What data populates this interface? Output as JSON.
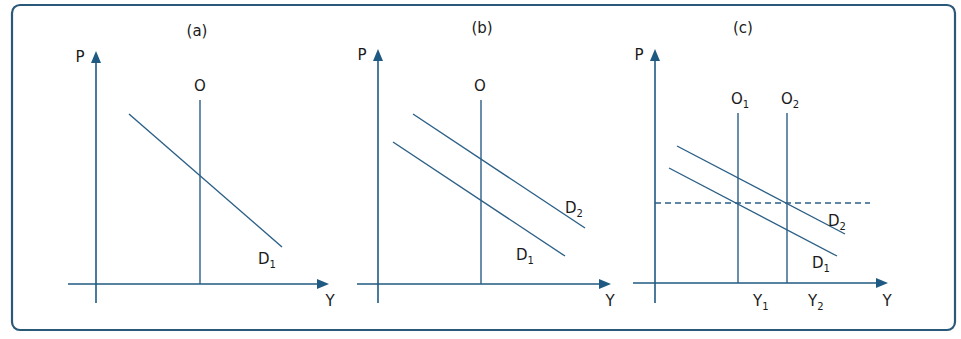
{
  "figure": {
    "panels": [
      {
        "id": "a",
        "title": "(a)",
        "y_axis_label": "P",
        "x_axis_label": "Y",
        "supply_lines": [
          {
            "label": "O",
            "sub": ""
          }
        ],
        "demand_lines": [
          {
            "label": "D",
            "sub": "1"
          }
        ]
      },
      {
        "id": "b",
        "title": "(b)",
        "y_axis_label": "P",
        "x_axis_label": "Y",
        "supply_lines": [
          {
            "label": "O",
            "sub": ""
          }
        ],
        "demand_lines": [
          {
            "label": "D",
            "sub": "1"
          },
          {
            "label": "D",
            "sub": "2"
          }
        ]
      },
      {
        "id": "c",
        "title": "(c)",
        "y_axis_label": "P",
        "x_axis_label": "Y",
        "supply_lines": [
          {
            "label": "O",
            "sub": "1"
          },
          {
            "label": "O",
            "sub": "2"
          }
        ],
        "demand_lines": [
          {
            "label": "D",
            "sub": "1"
          },
          {
            "label": "D",
            "sub": "2"
          }
        ],
        "x_markers": [
          {
            "label": "Y",
            "sub": "1"
          },
          {
            "label": "Y",
            "sub": "2"
          }
        ],
        "price_level": "dashed horizontal line at constant price"
      }
    ]
  },
  "colors": {
    "axis": "#1f5a82",
    "curve": "#2b5f86",
    "frame": "#2a5878",
    "text": "#1a1a1a"
  }
}
